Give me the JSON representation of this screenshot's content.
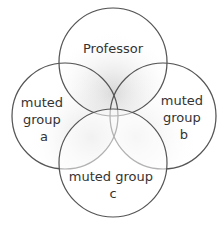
{
  "diagram": {
    "type": "venn",
    "circles": [
      {
        "id": "professor",
        "label_lines": [
          "Professor"
        ],
        "cx": 113,
        "cy": 62,
        "r": 54
      },
      {
        "id": "group-a",
        "label_lines": [
          "muted",
          "group",
          "a"
        ],
        "cx": 65,
        "cy": 116,
        "r": 53
      },
      {
        "id": "group-b",
        "label_lines": [
          "muted",
          "group",
          "b"
        ],
        "cx": 163,
        "cy": 116,
        "r": 53
      },
      {
        "id": "group-c",
        "label_lines": [
          "muted group",
          "c"
        ],
        "cx": 113,
        "cy": 163,
        "r": 54
      }
    ],
    "colors": {
      "stroke": "#555555",
      "shade": "#d8d8d8",
      "background": "#ffffff",
      "text": "#333333"
    }
  }
}
